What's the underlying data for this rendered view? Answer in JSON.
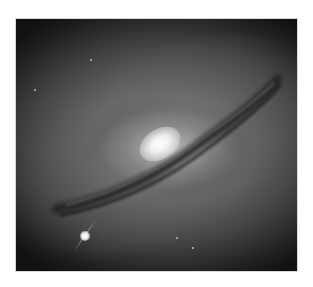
{
  "image": {
    "subject": "edge-on spiral galaxy with dark dust lane and bright core",
    "foreground_star": "bright star with diffraction spike at lower left",
    "colors": {
      "background": "#ffffff",
      "sky": "#111111",
      "core": "#ffffff",
      "dust_lane": "#2a2a2a"
    }
  }
}
